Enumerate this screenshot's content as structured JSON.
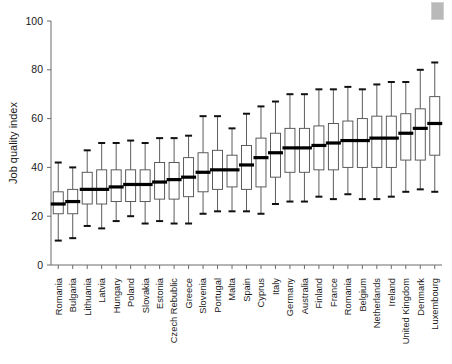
{
  "chart_data": {
    "type": "box",
    "title": "",
    "xlabel": "",
    "ylabel": "Job quality index",
    "ylim": [
      0,
      100
    ],
    "yticks": [
      0,
      20,
      40,
      60,
      80,
      100
    ],
    "grid": false,
    "legend": null,
    "categories": [
      "Romania",
      "Bulgaria",
      "Lithuania",
      "Latvia",
      "Hungary",
      "Poland",
      "Slovakia",
      "Estonia",
      "Czech Rebublic",
      "Greece",
      "Slovenia",
      "Portugal",
      "Malta",
      "Spain",
      "Cyprus",
      "Italy",
      "Germany",
      "Australia",
      "Finland",
      "France",
      "Romania",
      "Belgium",
      "Netherlands",
      "Ireland",
      "United Kingdom",
      "Denmark",
      "Luxembourg"
    ],
    "boxes": [
      {
        "category": "Romania",
        "whisker_low": 10,
        "q1": 21,
        "median": 25,
        "q3": 30,
        "whisker_high": 42
      },
      {
        "category": "Bulgaria",
        "whisker_low": 11,
        "q1": 21,
        "median": 26,
        "q3": 31,
        "whisker_high": 40
      },
      {
        "category": "Lithuania",
        "whisker_low": 16,
        "q1": 25,
        "median": 31,
        "q3": 38,
        "whisker_high": 47
      },
      {
        "category": "Latvia",
        "whisker_low": 15,
        "q1": 25,
        "median": 31,
        "q3": 39,
        "whisker_high": 50
      },
      {
        "category": "Hungary",
        "whisker_low": 18,
        "q1": 26,
        "median": 32,
        "q3": 39,
        "whisker_high": 50
      },
      {
        "category": "Poland",
        "whisker_low": 20,
        "q1": 26,
        "median": 33,
        "q3": 39,
        "whisker_high": 51
      },
      {
        "category": "Slovakia",
        "whisker_low": 17,
        "q1": 26,
        "median": 33,
        "q3": 39,
        "whisker_high": 50
      },
      {
        "category": "Estonia",
        "whisker_low": 18,
        "q1": 27,
        "median": 34,
        "q3": 42,
        "whisker_high": 52
      },
      {
        "category": "Czech Rebublic",
        "whisker_low": 17,
        "q1": 27,
        "median": 35,
        "q3": 42,
        "whisker_high": 52
      },
      {
        "category": "Greece",
        "whisker_low": 17,
        "q1": 28,
        "median": 36,
        "q3": 44,
        "whisker_high": 53
      },
      {
        "category": "Slovenia",
        "whisker_low": 21,
        "q1": 30,
        "median": 38,
        "q3": 46,
        "whisker_high": 61
      },
      {
        "category": "Portugal",
        "whisker_low": 22,
        "q1": 31,
        "median": 39,
        "q3": 47,
        "whisker_high": 61
      },
      {
        "category": "Malta",
        "whisker_low": 22,
        "q1": 32,
        "median": 39,
        "q3": 45,
        "whisker_high": 56
      },
      {
        "category": "Spain",
        "whisker_low": 22,
        "q1": 31,
        "median": 41,
        "q3": 49,
        "whisker_high": 62
      },
      {
        "category": "Cyprus",
        "whisker_low": 21,
        "q1": 32,
        "median": 44,
        "q3": 52,
        "whisker_high": 65
      },
      {
        "category": "Italy",
        "whisker_low": 25,
        "q1": 36,
        "median": 46,
        "q3": 54,
        "whisker_high": 67
      },
      {
        "category": "Germany",
        "whisker_low": 26,
        "q1": 38,
        "median": 48,
        "q3": 56,
        "whisker_high": 70
      },
      {
        "category": "Australia",
        "whisker_low": 26,
        "q1": 38,
        "median": 48,
        "q3": 56,
        "whisker_high": 70
      },
      {
        "category": "Finland",
        "whisker_low": 28,
        "q1": 39,
        "median": 49,
        "q3": 57,
        "whisker_high": 72
      },
      {
        "category": "France",
        "whisker_low": 27,
        "q1": 39,
        "median": 50,
        "q3": 58,
        "whisker_high": 72
      },
      {
        "category": "Romania",
        "whisker_low": 29,
        "q1": 40,
        "median": 51,
        "q3": 59,
        "whisker_high": 73
      },
      {
        "category": "Belgium",
        "whisker_low": 27,
        "q1": 40,
        "median": 51,
        "q3": 60,
        "whisker_high": 72
      },
      {
        "category": "Netherlands",
        "whisker_low": 27,
        "q1": 40,
        "median": 52,
        "q3": 61,
        "whisker_high": 74
      },
      {
        "category": "Ireland",
        "whisker_low": 28,
        "q1": 40,
        "median": 52,
        "q3": 61,
        "whisker_high": 75
      },
      {
        "category": "United Kingdom",
        "whisker_low": 30,
        "q1": 43,
        "median": 54,
        "q3": 62,
        "whisker_high": 75
      },
      {
        "category": "Denmark",
        "whisker_low": 31,
        "q1": 43,
        "median": 56,
        "q3": 64,
        "whisker_high": 80
      },
      {
        "category": "Luxembourg",
        "whisker_low": 30,
        "q1": 45,
        "median": 58,
        "q3": 69,
        "whisker_high": 83
      }
    ]
  },
  "style": {
    "line_color": "#4a4a4a",
    "median_color": "#000000",
    "box_fill": "#ffffff",
    "axis_color": "#6b6b6b",
    "text_color": "#1a1a1a",
    "artifact_color": "#b9b9b9"
  }
}
